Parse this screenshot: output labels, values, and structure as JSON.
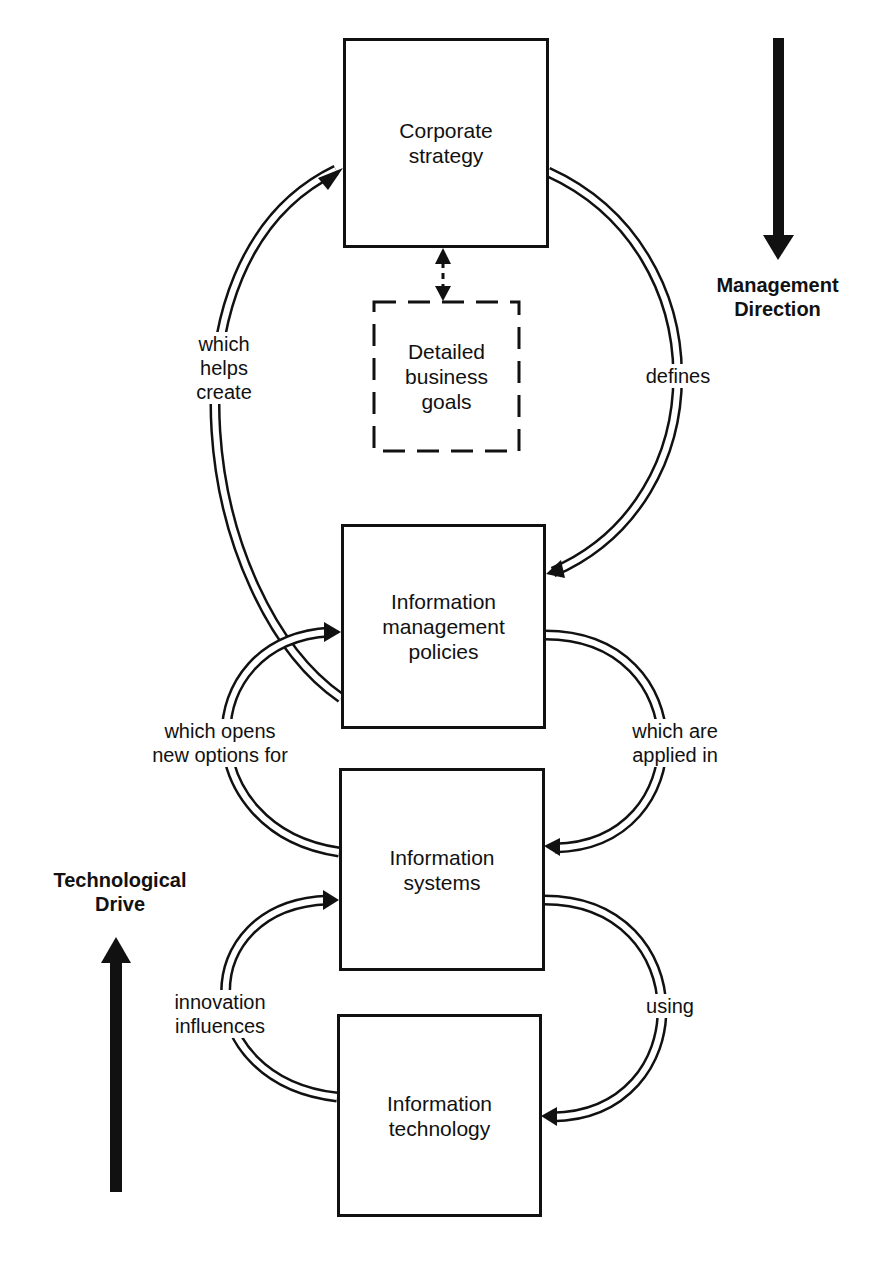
{
  "diagram": {
    "nodes": [
      {
        "id": "corporate-strategy",
        "label": "Corporate\nstrategy",
        "style": "solid"
      },
      {
        "id": "detailed-business-goals",
        "label": "Detailed\nbusiness\ngoals",
        "style": "dashed"
      },
      {
        "id": "information-management-policies",
        "label": "Information\nmanagement\npolicies",
        "style": "solid"
      },
      {
        "id": "information-systems",
        "label": "Information\nsystems",
        "style": "solid"
      },
      {
        "id": "information-technology",
        "label": "Information\ntechnology",
        "style": "solid"
      }
    ],
    "edges": [
      {
        "from": "corporate-strategy",
        "to": "information-management-policies",
        "label": "defines"
      },
      {
        "from": "information-management-policies",
        "to": "corporate-strategy",
        "label": "which\nhelps\ncreate"
      },
      {
        "from": "information-management-policies",
        "to": "information-systems",
        "label": "which are\napplied in"
      },
      {
        "from": "information-systems",
        "to": "information-management-policies",
        "label": "which opens\nnew options for"
      },
      {
        "from": "information-systems",
        "to": "information-technology",
        "label": "using"
      },
      {
        "from": "information-technology",
        "to": "information-systems",
        "label": "innovation\ninfluences"
      },
      {
        "from": "corporate-strategy",
        "to": "detailed-business-goals",
        "label": "",
        "style": "dashed-bidirectional"
      }
    ],
    "side_arrows": [
      {
        "label": "Management\nDirection",
        "direction": "down"
      },
      {
        "label": "Technological\nDrive",
        "direction": "up"
      }
    ]
  }
}
